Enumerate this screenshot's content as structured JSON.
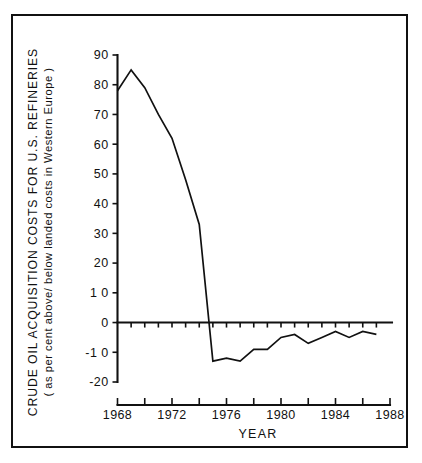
{
  "figure": {
    "background_color": "#ffffff",
    "ink_color": "#111111",
    "frame_visible": true
  },
  "chart_data": {
    "type": "line",
    "title": "",
    "subtitle": "",
    "xlabel": "YEAR",
    "ylabel_line1": "CRUDE OIL  ACQUISITION  COSTS  FOR  U.S.  REFINERIES",
    "ylabel_line2": "( as per cent above/ below  landed  costs in Western Europe )",
    "ylabel_full": "CRUDE OIL ACQUISITION COSTS FOR U.S. REFINERIES ( as per cent above/ below landed costs in Western Europe )",
    "xlim": [
      1968,
      1988
    ],
    "ylim": [
      -20,
      90
    ],
    "grid": false,
    "legend": "none",
    "x_major_ticks": [
      1968,
      1972,
      1976,
      1980,
      1984,
      1988
    ],
    "x_major_tick_labels": [
      "1968",
      "1972",
      "1976",
      "1980",
      "1984",
      "1988"
    ],
    "x_minor_ticks": [
      1970,
      1974,
      1978,
      1982,
      1986
    ],
    "y_ticks": [
      90,
      80,
      70,
      60,
      50,
      40,
      30,
      20,
      10,
      0,
      -10,
      -20
    ],
    "y_tick_labels": [
      "90",
      "80",
      "70",
      "60",
      "50",
      "40",
      "30",
      "20",
      "1 0",
      "0",
      "-1 0",
      "-20"
    ],
    "zero_line": 0,
    "series": [
      {
        "name": "Crude oil acquisition cost differential",
        "x": [
          1968,
          1969,
          1970,
          1971,
          1972,
          1973,
          1974,
          1975,
          1976,
          1977,
          1978,
          1979,
          1980,
          1981,
          1982,
          1983,
          1984,
          1985,
          1986,
          1987
        ],
        "values": [
          78,
          85,
          79,
          70,
          62,
          48,
          33,
          -13,
          -12,
          -13,
          -9,
          -9,
          -5,
          -4,
          -7,
          -5,
          -3,
          -5,
          -3,
          -4
        ]
      }
    ]
  }
}
